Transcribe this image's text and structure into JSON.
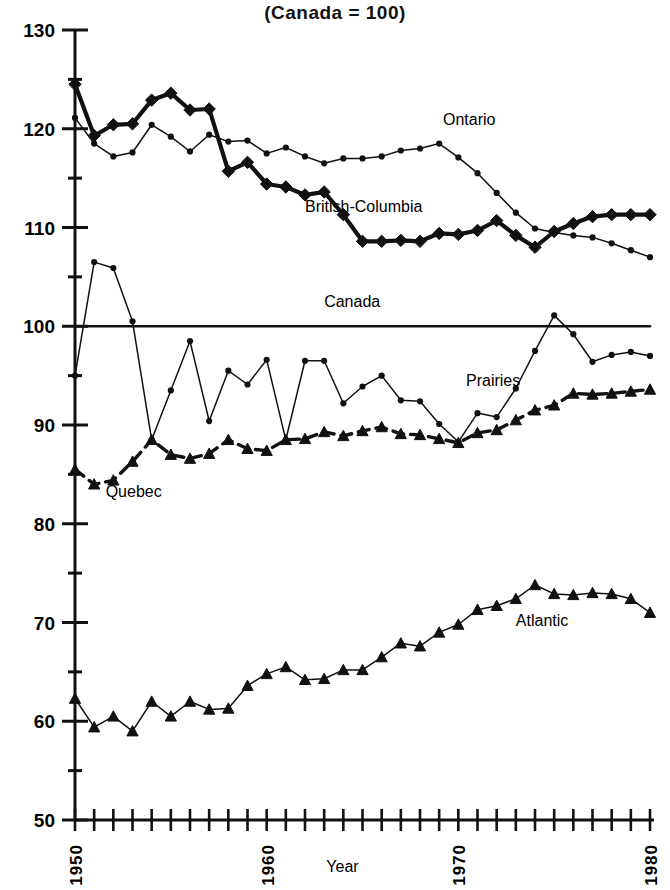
{
  "chart_data": {
    "type": "line",
    "title": "(Canada = 100)",
    "title_cut": "Average Earnings",
    "xlabel": "Year",
    "ylabel": "",
    "xlim": [
      1950,
      1980
    ],
    "ylim": [
      50,
      130
    ],
    "ytick_labels": [
      "130",
      "120",
      "110",
      "100",
      "90",
      "80",
      "70",
      "60",
      "50"
    ],
    "ytick_values": [
      130,
      120,
      110,
      100,
      90,
      80,
      70,
      60,
      50
    ],
    "yminor_step": 5,
    "xtick_labels": [
      "1950",
      "1960",
      "1970",
      "1980"
    ],
    "xtick_values": [
      1950,
      1960,
      1970,
      1980
    ],
    "xminor_step": 1,
    "grid": false,
    "legend": "inline-annotations",
    "x": [
      1950,
      1951,
      1952,
      1953,
      1954,
      1955,
      1956,
      1957,
      1958,
      1959,
      1960,
      1961,
      1962,
      1963,
      1964,
      1965,
      1966,
      1967,
      1968,
      1969,
      1970,
      1971,
      1972,
      1973,
      1974,
      1975,
      1976,
      1977,
      1978,
      1979,
      1980
    ],
    "series": [
      {
        "name": "British-Columbia",
        "label": "British-Columbia",
        "marker": "diamond",
        "line": "solid-thick",
        "color": "#111111",
        "label_x": 1962.0,
        "label_y": 111.6,
        "values": [
          124.5,
          119.3,
          120.4,
          120.5,
          122.9,
          123.6,
          121.9,
          122.0,
          115.7,
          116.6,
          114.4,
          114.1,
          113.3,
          113.6,
          111.3,
          108.6,
          108.6,
          108.7,
          108.6,
          109.4,
          109.3,
          109.7,
          110.7,
          109.2,
          108.0,
          109.6,
          110.4,
          111.1,
          111.3,
          111.3,
          111.3
        ]
      },
      {
        "name": "Ontario",
        "label": "Ontario",
        "marker": "dot",
        "line": "solid-thin",
        "color": "#111111",
        "label_x": 1969.2,
        "label_y": 120.4,
        "values": [
          121.1,
          118.5,
          117.2,
          117.6,
          120.4,
          119.2,
          117.7,
          119.4,
          118.7,
          118.8,
          117.5,
          118.1,
          117.2,
          116.5,
          117.0,
          117.0,
          117.2,
          117.8,
          118.0,
          118.5,
          117.1,
          115.5,
          113.5,
          111.5,
          109.9,
          109.5,
          109.2,
          109.0,
          108.4,
          107.7,
          107.0
        ]
      },
      {
        "name": "Canada",
        "label": "Canada",
        "marker": "none",
        "line": "reference",
        "color": "#111111",
        "label_x": 1963.0,
        "label_y": 101.9,
        "values": [
          100,
          100,
          100,
          100,
          100,
          100,
          100,
          100,
          100,
          100,
          100,
          100,
          100,
          100,
          100,
          100,
          100,
          100,
          100,
          100,
          100,
          100,
          100,
          100,
          100,
          100,
          100,
          100,
          100,
          100,
          100
        ]
      },
      {
        "name": "Prairies",
        "label": "Prairies",
        "marker": "dot",
        "line": "solid-thin",
        "color": "#111111",
        "label_x": 1970.4,
        "label_y": 94.0,
        "values": [
          95.0,
          106.5,
          105.9,
          100.5,
          88.5,
          93.5,
          98.5,
          90.4,
          95.5,
          94.1,
          96.6,
          88.5,
          96.5,
          96.5,
          92.2,
          93.9,
          95.0,
          92.5,
          92.4,
          90.1,
          88.3,
          91.2,
          90.8,
          93.7,
          97.5,
          101.1,
          99.2,
          96.4,
          97.1,
          97.4,
          97.0
        ]
      },
      {
        "name": "Quebec",
        "label": "Quebec",
        "marker": "triangle",
        "line": "dashed",
        "color": "#111111",
        "label_x": 1951.6,
        "label_y": 82.7,
        "values": [
          85.5,
          84.0,
          84.4,
          86.3,
          88.5,
          87.0,
          86.6,
          87.1,
          88.5,
          87.6,
          87.4,
          88.5,
          88.6,
          89.3,
          88.9,
          89.4,
          89.8,
          89.1,
          89.0,
          88.6,
          88.2,
          89.2,
          89.5,
          90.5,
          91.5,
          92.0,
          93.2,
          93.1,
          93.2,
          93.4,
          93.6
        ]
      },
      {
        "name": "Atlantic",
        "label": "Atlantic",
        "marker": "triangle",
        "line": "solid-thin",
        "color": "#111111",
        "label_x": 1973.0,
        "label_y": 69.6,
        "values": [
          62.3,
          59.4,
          60.5,
          59.0,
          62.0,
          60.5,
          62.0,
          61.2,
          61.3,
          63.6,
          64.8,
          65.5,
          64.2,
          64.3,
          65.2,
          65.2,
          66.5,
          67.9,
          67.6,
          69.0,
          69.8,
          71.3,
          71.7,
          72.4,
          73.8,
          72.9,
          72.8,
          73.0,
          72.9,
          72.4,
          71.0
        ]
      }
    ]
  }
}
